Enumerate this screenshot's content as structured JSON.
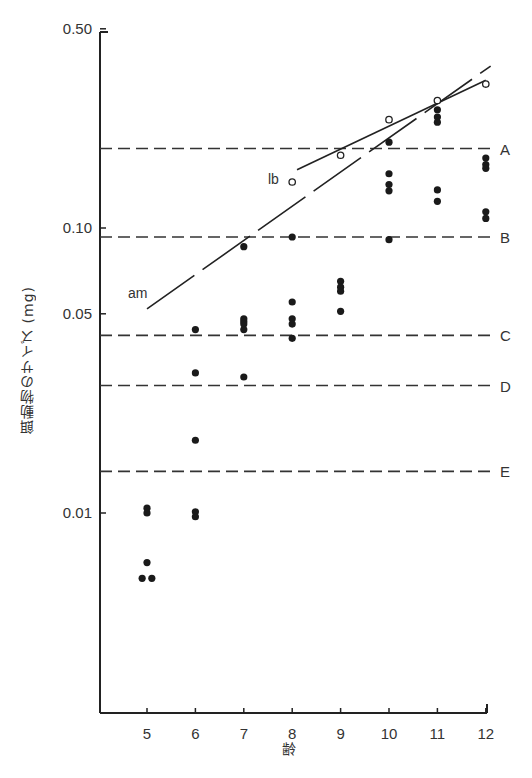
{
  "chart_data": {
    "type": "scatter",
    "title": "",
    "xlabel": "齢",
    "ylabel": "餌動物のサイズ (mg)",
    "yscale": "log",
    "ylim": [
      0.005,
      0.5
    ],
    "xlim": [
      4,
      12
    ],
    "x_ticks": [
      5,
      6,
      7,
      8,
      9,
      10,
      11,
      12
    ],
    "y_tick_labels": [
      "0.50",
      "0.10",
      "0.05",
      "0.01"
    ],
    "y_ticks": [
      0.5,
      0.1,
      0.05,
      0.01
    ],
    "grid": false,
    "series": [
      {
        "name": "filled-dots",
        "marker": "filled-circle",
        "points": [
          [
            5,
            0.0104
          ],
          [
            5,
            0.01
          ],
          [
            5,
            0.0067
          ],
          [
            4.9,
            0.0059
          ],
          [
            5.1,
            0.0059
          ],
          [
            6,
            0.044
          ],
          [
            6,
            0.031
          ],
          [
            6,
            0.018
          ],
          [
            6,
            0.0101
          ],
          [
            6,
            0.0097
          ],
          [
            7,
            0.086
          ],
          [
            7,
            0.048
          ],
          [
            7,
            0.047
          ],
          [
            7,
            0.046
          ],
          [
            7,
            0.044
          ],
          [
            7,
            0.03
          ],
          [
            8,
            0.093
          ],
          [
            8,
            0.055
          ],
          [
            8,
            0.048
          ],
          [
            8,
            0.046
          ],
          [
            8,
            0.041
          ],
          [
            9,
            0.065
          ],
          [
            9,
            0.062
          ],
          [
            9,
            0.06
          ],
          [
            9,
            0.051
          ],
          [
            10,
            0.2
          ],
          [
            10,
            0.155
          ],
          [
            10,
            0.142
          ],
          [
            10,
            0.135
          ],
          [
            10,
            0.091
          ],
          [
            11,
            0.26
          ],
          [
            11,
            0.245
          ],
          [
            11,
            0.235
          ],
          [
            11,
            0.136
          ],
          [
            11,
            0.124
          ],
          [
            12,
            0.176
          ],
          [
            12,
            0.167
          ],
          [
            12,
            0.162
          ],
          [
            12,
            0.114
          ],
          [
            12,
            0.108
          ]
        ]
      },
      {
        "name": "lb",
        "marker": "open-circle",
        "points": [
          [
            8,
            0.145
          ],
          [
            9,
            0.18
          ],
          [
            10,
            0.24
          ],
          [
            11,
            0.28
          ],
          [
            12,
            0.32
          ]
        ]
      }
    ],
    "fit_lines": [
      {
        "name": "lb",
        "label": "lb",
        "style": "solid",
        "from": [
          8.1,
          0.16
        ],
        "to": [
          12,
          0.33
        ]
      },
      {
        "name": "am",
        "label": "am",
        "style": "long-dash",
        "from": [
          5,
          0.052
        ],
        "to": [
          12.1,
          0.37
        ]
      }
    ],
    "reference_lines": [
      {
        "label": "A",
        "value": 0.19
      },
      {
        "label": "B",
        "value": 0.093
      },
      {
        "label": "C",
        "value": 0.042
      },
      {
        "label": "D",
        "value": 0.028
      },
      {
        "label": "E",
        "value": 0.014
      }
    ]
  },
  "labels": {
    "xlabel": "齢",
    "ylabel": "餌動物のサイズ (mg)",
    "lb": "lb",
    "am": "am"
  }
}
